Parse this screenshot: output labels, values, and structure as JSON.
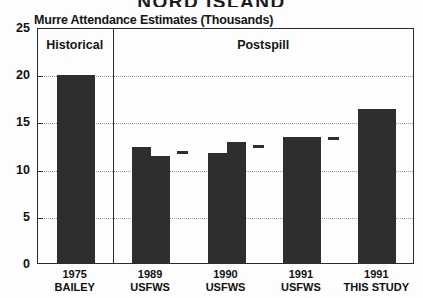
{
  "banner": {
    "text": "NORD ISLAND"
  },
  "chart_data": {
    "type": "bar",
    "title": "Murre Attendance Estimates (Thousands)",
    "xlabel": "",
    "ylabel": "",
    "ylim": [
      0,
      25
    ],
    "yticks": [
      0,
      5,
      10,
      15,
      20,
      25
    ],
    "grid": true,
    "legend": "none",
    "panels": [
      {
        "label": "Historical",
        "span": [
          0,
          1
        ]
      },
      {
        "label": "Postspill",
        "span": [
          1,
          5
        ]
      }
    ],
    "categories": [
      {
        "year": "1975",
        "source": "BAILEY"
      },
      {
        "year": "1989",
        "source": "USFWS"
      },
      {
        "year": "1990",
        "source": "USFWS"
      },
      {
        "year": "1991",
        "source": "USFWS"
      },
      {
        "year": "1991",
        "source": "THIS STUDY"
      }
    ],
    "values": [
      19.9,
      12.3,
      11.7,
      13.3,
      16.3
    ],
    "secondary_values": [
      null,
      11.3,
      12.8,
      13.3,
      null
    ],
    "markers": [
      null,
      11.9,
      12.6,
      13.4,
      null
    ]
  }
}
